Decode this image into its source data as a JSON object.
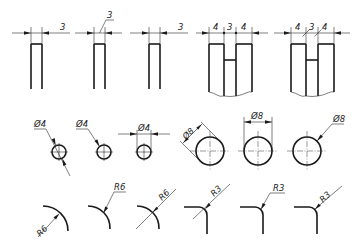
{
  "row_linear": {
    "fig1": {
      "value": "3"
    },
    "fig2": {
      "value": "3"
    },
    "fig3": {
      "value": "3"
    },
    "fig4": {
      "values": [
        "4",
        "3",
        "4"
      ]
    },
    "fig5": {
      "values": [
        "4",
        "3",
        "4"
      ]
    }
  },
  "row_diameter": {
    "small": [
      {
        "value": "Ø4"
      },
      {
        "value": "Ø4"
      },
      {
        "value": "Ø4"
      }
    ],
    "large": [
      {
        "value": "Ø8"
      },
      {
        "value": "Ø8"
      },
      {
        "value": "Ø8"
      }
    ]
  },
  "row_radius": {
    "r6": [
      {
        "value": "R6"
      },
      {
        "value": "R6"
      },
      {
        "value": "R6"
      }
    ],
    "r3": [
      {
        "value": "R3"
      },
      {
        "value": "R3"
      },
      {
        "value": "R3"
      }
    ]
  }
}
